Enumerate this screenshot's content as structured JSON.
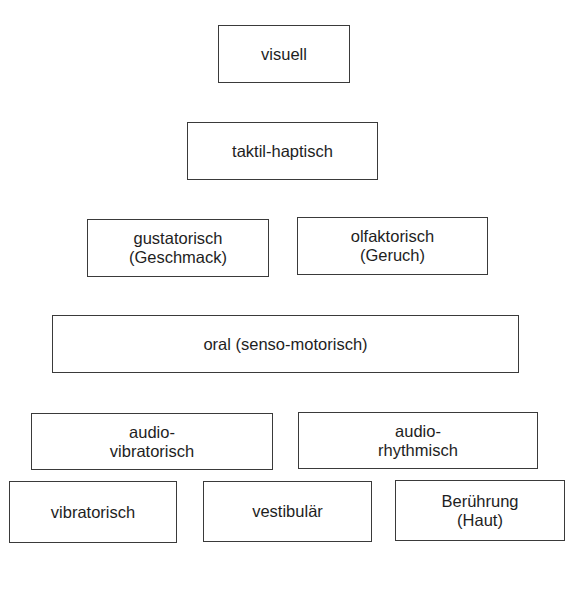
{
  "diagram": {
    "type": "hierarchy-of-senses",
    "rows": [
      {
        "boxes": [
          {
            "lines": [
              "visuell"
            ]
          }
        ]
      },
      {
        "boxes": [
          {
            "lines": [
              "taktil-haptisch"
            ]
          }
        ]
      },
      {
        "boxes": [
          {
            "lines": [
              "gustatorisch",
              "(Geschmack)"
            ]
          },
          {
            "lines": [
              "olfaktorisch",
              "(Geruch)"
            ]
          }
        ]
      },
      {
        "boxes": [
          {
            "lines": [
              "oral (senso-motorisch)"
            ]
          }
        ]
      },
      {
        "boxes": [
          {
            "lines": [
              "audio-",
              "vibratorisch"
            ]
          },
          {
            "lines": [
              "audio-",
              "rhythmisch"
            ]
          }
        ]
      },
      {
        "boxes": [
          {
            "lines": [
              "vibratorisch"
            ]
          },
          {
            "lines": [
              "vestibulär"
            ]
          },
          {
            "lines": [
              "Berührung",
              "(Haut)"
            ]
          }
        ]
      }
    ],
    "colors": {
      "border": "#3a3a3a",
      "text": "#1e1e1e",
      "background": "#ffffff"
    }
  }
}
